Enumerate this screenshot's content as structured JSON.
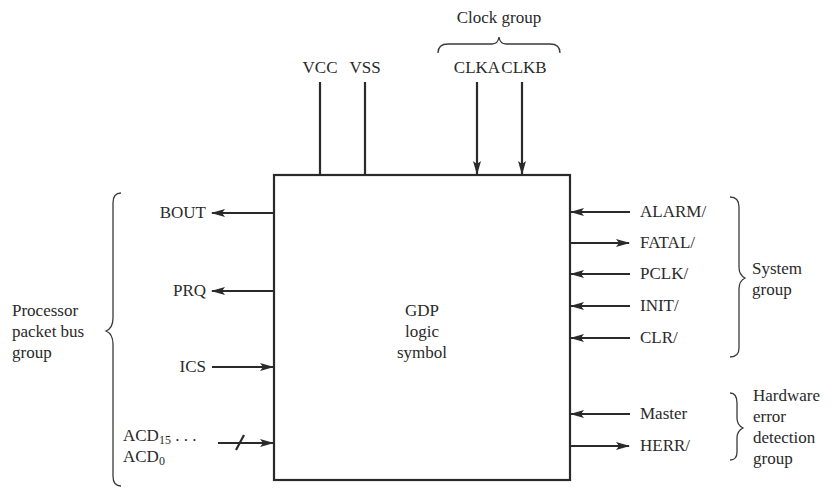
{
  "diagram": {
    "type": "logic symbol block diagram",
    "block": {
      "label_lines": [
        "GDP",
        "logic",
        "symbol"
      ]
    },
    "top": {
      "power": [
        {
          "name": "VCC",
          "direction": "none"
        },
        {
          "name": "VSS",
          "direction": "none"
        }
      ],
      "clock_group": {
        "label": "Clock group",
        "signals": [
          {
            "name": "CLKA",
            "direction": "in"
          },
          {
            "name": "CLKB",
            "direction": "in"
          }
        ]
      }
    },
    "left_group": {
      "label_lines": [
        "Processor",
        "packet bus",
        "group"
      ],
      "signals": [
        {
          "name": "BOUT",
          "direction": "out"
        },
        {
          "name": "PRQ",
          "direction": "out"
        },
        {
          "name": "ICS",
          "direction": "in"
        },
        {
          "name": "ACD",
          "sub_hi": "15",
          "ellipsis": " . . .",
          "sub_lo": "0",
          "direction": "in",
          "bus": true
        }
      ]
    },
    "right_groups": [
      {
        "label_lines": [
          "System",
          "group"
        ],
        "signals": [
          {
            "name": "ALARM/",
            "direction": "in"
          },
          {
            "name": "FATAL/",
            "direction": "out"
          },
          {
            "name": "PCLK/",
            "direction": "in"
          },
          {
            "name": "INIT/",
            "direction": "in"
          },
          {
            "name": "CLR/",
            "direction": "in"
          }
        ]
      },
      {
        "label_lines": [
          "Hardware",
          "error",
          "detection",
          "group"
        ],
        "signals": [
          {
            "name": "Master",
            "direction": "in"
          },
          {
            "name": "HERR/",
            "direction": "out"
          }
        ]
      }
    ]
  }
}
